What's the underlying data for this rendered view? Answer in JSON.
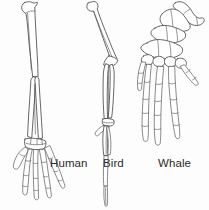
{
  "figure": {
    "background_color": "#fdfdfd",
    "line_color": "#4a4a4a",
    "bone_fill_color": "#ffffff",
    "label_color": "#2b2b2b",
    "style": "black-and-white line drawing"
  },
  "specimens": [
    {
      "id": "human",
      "label": "Human",
      "label_position": {
        "x": 50,
        "y": 158
      },
      "description": "Human arm skeleton, vertical, with humerus, radius, ulna, carpals and five splayed digits",
      "bones": [
        "humerus",
        "radius",
        "ulna",
        "carpals",
        "metacarpals",
        "phalanges"
      ],
      "digit_count": 5
    },
    {
      "id": "bird",
      "label": "Bird",
      "label_position": {
        "x": 103,
        "y": 158
      },
      "description": "Bird wing skeleton, elongated and narrow, with humerus, radius, ulna, fused carpometacarpus and reduced digits",
      "bones": [
        "humerus",
        "radius",
        "ulna",
        "carpometacarpus",
        "phalanges"
      ],
      "digit_count": 3
    },
    {
      "id": "whale",
      "label": "Whale",
      "label_position": {
        "x": 158,
        "y": 158
      },
      "description": "Whale flipper skeleton, broad and paddle-shaped, with short humerus, radius, ulna and five digits of multiple phalanges",
      "bones": [
        "humerus",
        "radius",
        "ulna",
        "carpals",
        "metacarpals",
        "phalanges"
      ],
      "digit_count": 5
    }
  ]
}
